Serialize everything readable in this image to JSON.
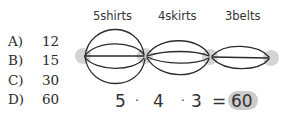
{
  "choices": [
    {
      "letter": "A)",
      "value": "12",
      "selected": false
    },
    {
      "letter": "B)",
      "value": "15",
      "selected": false
    },
    {
      "letter": "C)",
      "value": "30",
      "selected": false
    },
    {
      "letter": "D)",
      "value": "60",
      "selected": true
    }
  ],
  "diagram": {
    "labels": [
      "5shirts",
      "4skirts",
      "3belts"
    ],
    "equation": {
      "factors": [
        "5",
        "4",
        "3"
      ],
      "operator": "·",
      "equals": "=",
      "result": "60"
    },
    "highlight_color": "#cccccc",
    "node_color": "#d4d4d4",
    "stroke_color": "#2b2b2b"
  }
}
